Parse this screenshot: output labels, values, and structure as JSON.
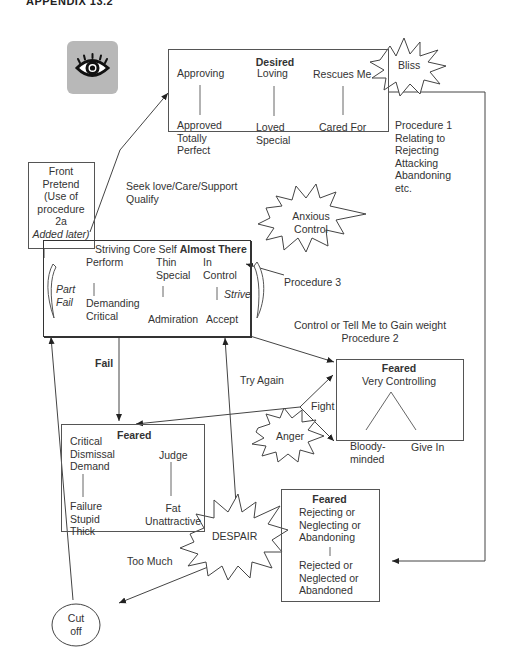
{
  "header": {
    "title": "APPENDIX 13.2"
  },
  "icon": {
    "name": "eye-icon"
  },
  "desired_box": {
    "title": "Desired",
    "columns": [
      {
        "top": "Approving",
        "bottom": [
          "Approved",
          "Totally",
          "Perfect"
        ]
      },
      {
        "top": "Loving",
        "bottom": [
          "Loved",
          "Special"
        ]
      },
      {
        "top": "Rescues Me",
        "bottom": [
          "Cared For"
        ]
      }
    ]
  },
  "bursts": {
    "bliss": "Bliss",
    "anxious_control": [
      "Anxious",
      "Control"
    ],
    "anger": "Anger",
    "despair": "DESPAIR"
  },
  "procedure1": [
    "Procedure 1",
    "Relating to",
    "Rejecting",
    "Attacking",
    "Abandoning",
    "etc."
  ],
  "front_box": {
    "lines": [
      "Front",
      "Pretend",
      "(Use of",
      "procedure",
      "2a"
    ],
    "italic_line": "Added later)"
  },
  "seek_label": [
    "Seek love/Care/Support",
    "Qualify"
  ],
  "core_box": {
    "title_prefix": "Striving Core Self ",
    "title_bold": "Almost There",
    "columns": [
      {
        "top": [
          "Perform"
        ],
        "bottom": [
          "Demanding",
          "Critical"
        ]
      },
      {
        "top": [
          "Thin",
          "Special"
        ],
        "bottom": [
          "Admiration"
        ]
      },
      {
        "top": [
          "In",
          "Control"
        ],
        "bottom": [
          "Accept"
        ]
      }
    ],
    "left_arrow_label": [
      "Part",
      "Fail"
    ],
    "right_arrow_label": "Strive"
  },
  "procedure3": "Procedure 3",
  "control_label": [
    "Control or Tell Me to Gain weight",
    "Procedure 2"
  ],
  "fail_label": "Fail",
  "try_again_label": "Try Again",
  "fight_label": "Fight",
  "too_much_label": "Too Much",
  "feared_controlling": {
    "title": "Feared",
    "subtitle": "Very Controlling",
    "left": [
      "Bloody-",
      "minded"
    ],
    "right": "Give In"
  },
  "feared_critical": {
    "title": "Feared",
    "left_top": [
      "Critical",
      "Dismissal",
      "Demand"
    ],
    "left_bottom": [
      "Failure",
      "Stupid",
      "Thick"
    ],
    "right_top": "Judge",
    "right_bottom": [
      "Fat",
      "Unattractive"
    ]
  },
  "feared_rejecting": {
    "title": "Feared",
    "top": [
      "Rejecting or",
      "Neglecting or",
      "Abandoning"
    ],
    "bottom": [
      "Rejected or",
      "Neglected or",
      "Abandoned"
    ]
  },
  "cutoff": [
    "Cut",
    "off"
  ]
}
